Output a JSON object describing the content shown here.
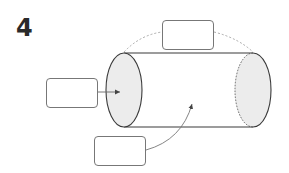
{
  "figure": {
    "number": "4"
  },
  "labels": {
    "top_box": "",
    "left_box": "",
    "bottom_box": ""
  },
  "colors": {
    "outline": "#3a3a3a",
    "face_fill": "#ececec",
    "dashed": "#9a9a9a",
    "leader": "#777777",
    "box_border": "#777777"
  }
}
